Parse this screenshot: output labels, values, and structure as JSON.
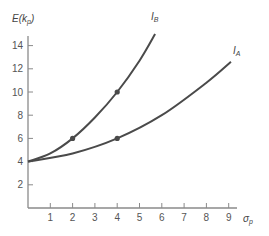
{
  "chart_data": {
    "type": "line",
    "title": "",
    "xlabel": "σ_p",
    "ylabel": "E(k_p)",
    "xlim": [
      0,
      9.5
    ],
    "ylim": [
      0,
      15
    ],
    "x_ticks": [
      1,
      2,
      3,
      4,
      5,
      6,
      7,
      8,
      9
    ],
    "y_ticks": [
      2,
      4,
      6,
      8,
      10,
      12,
      14
    ],
    "grid": false,
    "legend": "inline curve labels at line ends",
    "series": [
      {
        "name": "I_B",
        "label_main": "I",
        "label_sub": "B",
        "points": [
          [
            0,
            4
          ],
          [
            1,
            4.7
          ],
          [
            2,
            6
          ],
          [
            3,
            7.8
          ],
          [
            4,
            10
          ],
          [
            5,
            12.7
          ],
          [
            5.7,
            15
          ]
        ],
        "marked_points": [
          [
            2,
            6
          ],
          [
            4,
            10
          ]
        ]
      },
      {
        "name": "I_A",
        "label_main": "I",
        "label_sub": "A",
        "points": [
          [
            0,
            4
          ],
          [
            2,
            4.7
          ],
          [
            4,
            6
          ],
          [
            6,
            8
          ],
          [
            8,
            10.8
          ],
          [
            9.1,
            12.6
          ]
        ],
        "marked_points": [
          [
            4,
            6
          ]
        ]
      }
    ]
  },
  "axes": {
    "y_label_main": "E(k",
    "y_label_sub": "p",
    "y_label_close": ")",
    "x_label_main": "σ",
    "x_label_sub": "p"
  },
  "colors": {
    "curve": "#4a4a4a",
    "axis": "#8a8a8a",
    "text": "#555555"
  }
}
